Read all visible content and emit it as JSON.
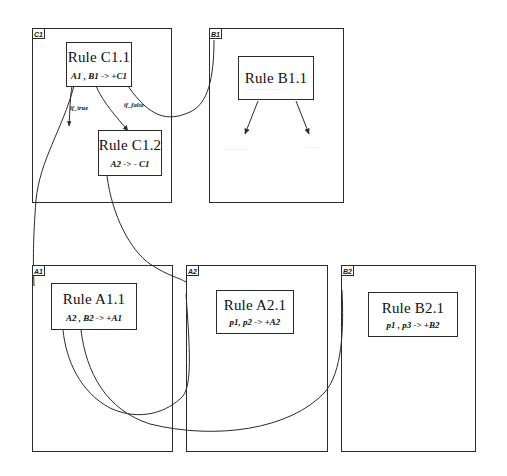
{
  "diagram": {
    "modules": [
      {
        "id": "C1",
        "tab_label": "C1",
        "rules": [
          {
            "id": "C1.1",
            "title": "Rule C1.1",
            "body": "A1 , B1 -> +C1"
          },
          {
            "id": "C1.2",
            "title": "Rule C1.2",
            "body": "A2 -> - C1"
          }
        ]
      },
      {
        "id": "B1",
        "tab_label": "B1",
        "rules": [
          {
            "id": "B1.1",
            "title": "Rule B1.1",
            "body": ""
          }
        ],
        "faint_text": [
          "............................",
          "..................",
          ".............."
        ]
      },
      {
        "id": "A1",
        "tab_label": "A1",
        "rules": [
          {
            "id": "A1.1",
            "title": "Rule A1.1",
            "body": "A2 , B2 -> +A1"
          }
        ]
      },
      {
        "id": "A2",
        "tab_label": "A2",
        "rules": [
          {
            "id": "A2.1",
            "title": "Rule A2.1",
            "body": "p1, p2 -> +A2"
          }
        ]
      },
      {
        "id": "B2",
        "tab_label": "B2",
        "rules": [
          {
            "id": "B2.1",
            "title": "Rule B2.1",
            "body": "p1 , p3 -> +B2"
          }
        ]
      }
    ],
    "edge_labels": [
      {
        "id": "if-true",
        "text": "if_true"
      },
      {
        "id": "if-false",
        "text": "if_false"
      }
    ],
    "colors": {
      "line": "#2b2b2b",
      "text": "#101010",
      "faint": "#9a9a9a",
      "background": "#ffffff"
    }
  }
}
